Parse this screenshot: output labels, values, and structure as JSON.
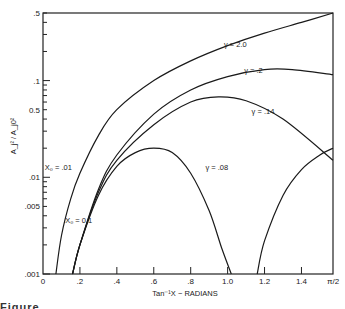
{
  "chart_data": {
    "type": "line",
    "title": "",
    "xlabel": "Tan⁻¹X − RADIANS",
    "ylabel": "A_j² / A_j0²",
    "xscale": "linear",
    "yscale": "log",
    "xlim": [
      0,
      1.5708
    ],
    "ylim": [
      0.001,
      0.5
    ],
    "x_ticks": [
      0,
      0.2,
      0.4,
      0.6,
      0.8,
      1.0,
      1.2,
      1.4,
      1.5708
    ],
    "x_tick_labels": [
      "0",
      ".2",
      ".4",
      ".6",
      ".8",
      "1.0",
      "1.2",
      "1.4",
      "π/2"
    ],
    "y_ticks": [
      0.001,
      0.005,
      0.01,
      0.05,
      0.1,
      0.5
    ],
    "y_tick_labels": [
      ".001",
      ".005",
      ".01",
      "0.5",
      ".1",
      ".5"
    ],
    "grid": false,
    "legend": "inline curve labels",
    "annotations": [
      {
        "text": "γ = 2.0",
        "x": 0.98,
        "y": 0.22
      },
      {
        "text": "γ = .2",
        "x": 1.09,
        "y": 0.12
      },
      {
        "text": "γ = .14",
        "x": 1.13,
        "y": 0.045
      },
      {
        "text": "γ = .08",
        "x": 0.88,
        "y": 0.012
      },
      {
        "text": "X₀ = .01",
        "x": 0.01,
        "y": 0.012
      },
      {
        "text": "X₀ = 0.1",
        "x": 0.12,
        "y": 0.0034
      }
    ],
    "series": [
      {
        "name": "γ = 2.0 (X₀ = .01)",
        "x": [
          0.07,
          0.1,
          0.15,
          0.2,
          0.3,
          0.4,
          0.6,
          0.8,
          1.0,
          1.2,
          1.4,
          1.5708
        ],
        "y": [
          0.001,
          0.0025,
          0.006,
          0.011,
          0.027,
          0.05,
          0.1,
          0.16,
          0.23,
          0.31,
          0.4,
          0.5
        ]
      },
      {
        "name": "γ = .2",
        "x": [
          0.16,
          0.2,
          0.3,
          0.4,
          0.6,
          0.8,
          1.0,
          1.2,
          1.35,
          1.5708
        ],
        "y": [
          0.001,
          0.002,
          0.0075,
          0.017,
          0.045,
          0.08,
          0.11,
          0.13,
          0.13,
          0.115
        ]
      },
      {
        "name": "γ = .14",
        "x": [
          0.16,
          0.2,
          0.3,
          0.4,
          0.6,
          0.8,
          0.95,
          1.1,
          1.3,
          1.5708
        ],
        "y": [
          0.001,
          0.002,
          0.007,
          0.015,
          0.035,
          0.06,
          0.068,
          0.062,
          0.04,
          0.015
        ]
      },
      {
        "name": "γ = .08 (left lobe)",
        "x": [
          0.16,
          0.2,
          0.3,
          0.4,
          0.5,
          0.6,
          0.7,
          0.8,
          0.9,
          0.97,
          1.02
        ],
        "y": [
          0.001,
          0.002,
          0.0065,
          0.013,
          0.018,
          0.02,
          0.018,
          0.011,
          0.0045,
          0.0018,
          0.001
        ]
      },
      {
        "name": "γ = .08 (right lobe)",
        "x": [
          1.16,
          1.2,
          1.3,
          1.4,
          1.5,
          1.5708
        ],
        "y": [
          0.001,
          0.0022,
          0.0065,
          0.012,
          0.017,
          0.02
        ]
      }
    ]
  },
  "axes": {
    "xlabel": "Tan⁻¹X − RADIANS",
    "ylabel": "A_j² / A_j0²"
  },
  "caption": "Figure"
}
